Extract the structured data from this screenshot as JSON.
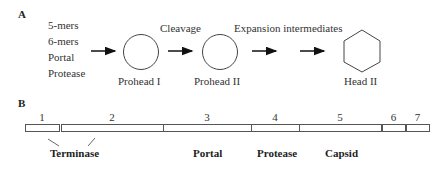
{
  "panel_a": {
    "label": "A",
    "inputs": [
      "5-mers",
      "6-mers",
      "Portal",
      "Protease"
    ],
    "step_labels": {
      "cleavage": "Cleavage",
      "expansion": "Expansion intermediates"
    },
    "stages": [
      {
        "name": "Prohead I",
        "shape": "circle"
      },
      {
        "name": "Prohead II",
        "shape": "circle"
      },
      {
        "name": "Head II",
        "shape": "hexagon"
      }
    ]
  },
  "panel_b": {
    "label": "B",
    "genes": [
      {
        "number": "1",
        "x": 25,
        "width": 34
      },
      {
        "number": "2",
        "x": 61,
        "width": 102
      },
      {
        "number": "3",
        "x": 163,
        "width": 88
      },
      {
        "number": "4",
        "x": 251,
        "width": 48
      },
      {
        "number": "5",
        "x": 299,
        "width": 82
      },
      {
        "number": "6",
        "x": 382,
        "width": 23
      },
      {
        "number": "7",
        "x": 406,
        "width": 23
      }
    ],
    "functions": [
      {
        "name": "Terminase",
        "genes": [
          "1",
          "2"
        ]
      },
      {
        "name": "Portal",
        "genes": [
          "3"
        ]
      },
      {
        "name": "Protease",
        "genes": [
          "4"
        ]
      },
      {
        "name": "Capsid",
        "genes": [
          "5"
        ]
      }
    ]
  }
}
